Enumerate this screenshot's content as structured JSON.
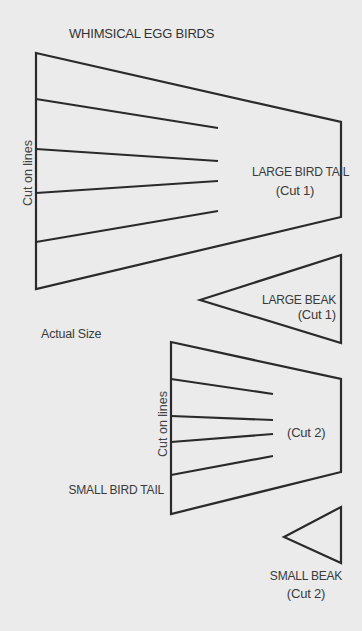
{
  "title": "WHIMSICAL EGG BIRDS",
  "note": "Actual Size",
  "large_tail": {
    "instruction": "Cut on lines",
    "label": "LARGE BIRD TAIL",
    "count": "(Cut 1)"
  },
  "large_beak": {
    "label": "LARGE BEAK",
    "count": "(Cut 1)"
  },
  "small_tail": {
    "instruction": "Cut on lines",
    "label": "SMALL BIRD TAIL",
    "count": "(Cut 2)"
  },
  "small_beak": {
    "label": "SMALL BEAK",
    "count": "(Cut 2)"
  },
  "colors": {
    "paper": "#ebebeb",
    "ink": "#2a2a2a"
  }
}
